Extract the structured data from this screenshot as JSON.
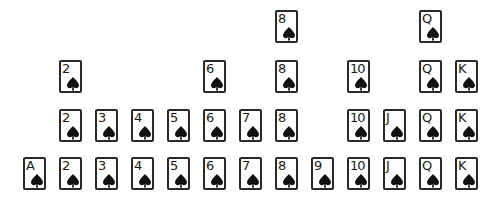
{
  "board": {
    "suit": "spade",
    "columns": [
      "A",
      "2",
      "3",
      "4",
      "5",
      "6",
      "7",
      "8",
      "9",
      "10",
      "J",
      "Q",
      "K"
    ],
    "column_x": [
      23,
      59,
      95,
      131,
      167,
      203,
      239,
      275,
      311,
      347,
      383,
      419,
      455
    ],
    "row_y": [
      10,
      60,
      109,
      157
    ],
    "rows": [
      {
        "cards": [
          "8",
          "Q"
        ]
      },
      {
        "cards": [
          "2",
          "6",
          "8",
          "10",
          "Q",
          "K"
        ]
      },
      {
        "cards": [
          "2",
          "3",
          "4",
          "5",
          "6",
          "7",
          "8",
          "10",
          "J",
          "Q",
          "K"
        ]
      },
      {
        "cards": [
          "A",
          "2",
          "3",
          "4",
          "5",
          "6",
          "7",
          "8",
          "9",
          "10",
          "J",
          "Q",
          "K"
        ]
      }
    ]
  },
  "colors": {
    "card_border": "#2a2a2a",
    "card_face": "#ffffff",
    "ink": "#1a1a1a",
    "background": "#ffffff"
  }
}
